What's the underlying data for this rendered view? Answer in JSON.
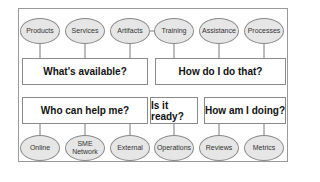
{
  "diagram": {
    "top_left": {
      "question": "What's available?",
      "items": [
        "Products",
        "Services",
        "Artifacts"
      ]
    },
    "top_right": {
      "question": "How do I do that?",
      "items": [
        "Training",
        "Assistance",
        "Processes"
      ]
    },
    "bottom_left": {
      "question": "Who can help me?",
      "items": [
        "Online",
        "SME Network",
        "External"
      ]
    },
    "bottom_middle": {
      "question": "Is it ready?",
      "items": [
        "Operations"
      ]
    },
    "bottom_right": {
      "question": "How am I doing?",
      "items": [
        "Reviews",
        "Metrics"
      ]
    },
    "colors": {
      "ellipse_fill": "#e6e6e6",
      "stroke": "#8a8a8a",
      "box_fill": "#ffffff"
    }
  }
}
